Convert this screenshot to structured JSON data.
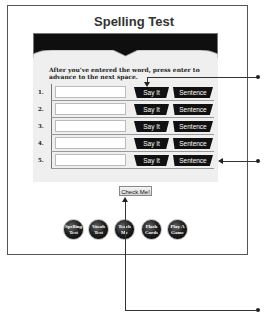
{
  "app": {
    "title": "Spelling Test",
    "instructions": "After you've entered the word, press enter to advance to the next space."
  },
  "rows": [
    {
      "number": "1.",
      "value": "",
      "say_label": "Say It",
      "sentence_label": "Sentence"
    },
    {
      "number": "2.",
      "value": "",
      "say_label": "Say It",
      "sentence_label": "Sentence"
    },
    {
      "number": "3.",
      "value": "",
      "say_label": "Say It",
      "sentence_label": "Sentence"
    },
    {
      "number": "4.",
      "value": "",
      "say_label": "Say It",
      "sentence_label": "Sentence"
    },
    {
      "number": "5.",
      "value": "",
      "say_label": "Say It",
      "sentence_label": "Sentence"
    }
  ],
  "check_button": {
    "label": "Check Me!"
  },
  "nav_buttons": [
    {
      "label": "Spelling Test"
    },
    {
      "label": "Vocab Test"
    },
    {
      "label": "Teach Me"
    },
    {
      "label": "Flash Cards"
    },
    {
      "label": "Play A Game"
    }
  ],
  "colors": {
    "banner": "#0d0d0d",
    "panel": "#efefef",
    "button": "#111111",
    "frame": "#555555"
  }
}
